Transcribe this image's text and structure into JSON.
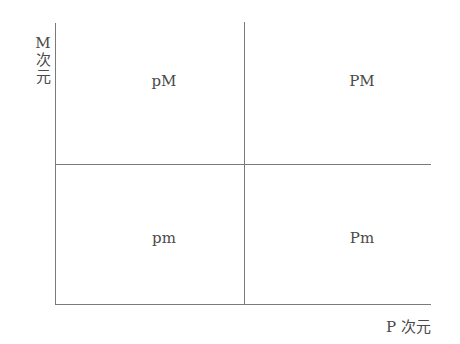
{
  "diagram": {
    "type": "2x2 quadrant matrix",
    "y_axis": {
      "label_line1": "M",
      "label_line2": "次",
      "label_line3": "元",
      "label": "M次元"
    },
    "x_axis": {
      "label": "P 次元"
    },
    "quadrants": {
      "top_left": "pM",
      "top_right": "PM",
      "bottom_left": "pm",
      "bottom_right": "Pm"
    },
    "colors": {
      "line": "#7a7a7a",
      "text": "#4a4a4a",
      "background": "#ffffff"
    }
  }
}
